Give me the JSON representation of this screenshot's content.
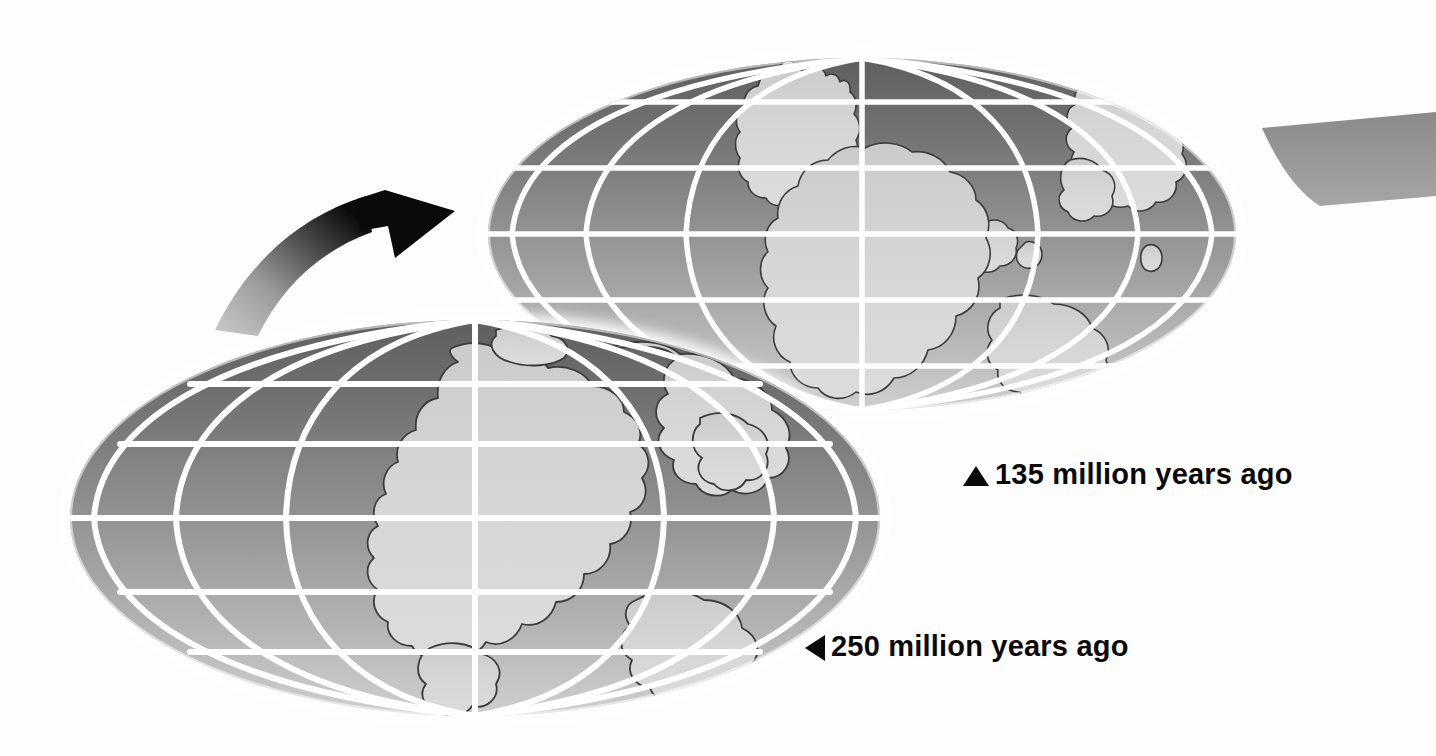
{
  "figure": {
    "kind": "continental-drift-globes",
    "background_color": "#fdfdfd",
    "page_width": 1436,
    "page_height": 756
  },
  "captions": [
    {
      "id": "caption-135",
      "marker": "triangle-up",
      "marker_icon": "triangle-up-icon",
      "text": "135 million years ago",
      "age_value": 135,
      "age_unit": "million years ago",
      "color": "#0a0a0a",
      "x": 963,
      "y": 460
    },
    {
      "id": "caption-250",
      "marker": "triangle-left",
      "marker_icon": "triangle-left-icon",
      "text": "250 million years ago",
      "age_value": 250,
      "age_unit": "million years ago",
      "color": "#0a0a0a",
      "x": 805,
      "y": 632
    }
  ],
  "globes": [
    {
      "id": "globe-135",
      "label": "135 million years ago",
      "projection": "mollweide-ellipse",
      "center_x": 862,
      "center_y": 234,
      "radius_x": 374,
      "radius_y": 176,
      "meridian_count": 7,
      "parallel_count": 5,
      "graticule_color": "#ffffff",
      "ocean_top_color": "#6e6e6e",
      "ocean_bottom_color": "#c9c9c9",
      "land_color": "#d4d4d4",
      "land_outline_color": "#3c3c3c"
    },
    {
      "id": "globe-250",
      "label": "250 million years ago",
      "projection": "mollweide-ellipse",
      "center_x": 475,
      "center_y": 518,
      "radius_x": 405,
      "radius_y": 198,
      "meridian_count": 7,
      "parallel_count": 5,
      "graticule_color": "#ffffff",
      "ocean_top_color": "#6e6e6e",
      "ocean_bottom_color": "#c9c9c9",
      "land_color": "#d4d4d4",
      "land_outline_color": "#3c3c3c"
    }
  ],
  "arrow": {
    "id": "drift-arrow",
    "description": "curved arrow pointing up-right from 250 Ma globe to 135 Ma globe",
    "tail_color": "#b4b4b4",
    "head_color": "#0a0a0a",
    "direction": "up-right"
  },
  "edge_fragment": {
    "id": "globe-fragment-right",
    "description": "cropped gray wedge of a further globe at right page edge",
    "color": "#8c8c8c"
  },
  "colors": {
    "ocean_dark": "#6e6e6e",
    "ocean_mid": "#9a9a9a",
    "ocean_light": "#c9c9c9",
    "land": "#d4d4d4",
    "land_line": "#3c3c3c",
    "graticule": "#ffffff",
    "ink": "#0a0a0a",
    "page": "#fdfdfd"
  }
}
